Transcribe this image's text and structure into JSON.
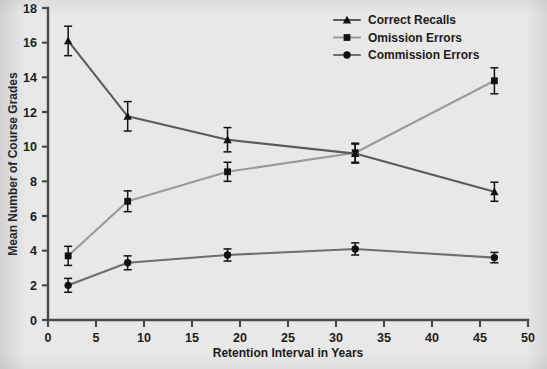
{
  "chart_data": {
    "type": "line",
    "title": "",
    "xlabel": "Retention Interval in Years",
    "ylabel": "Mean Number of Course Grades",
    "xlim": [
      0,
      50
    ],
    "ylim": [
      0,
      18
    ],
    "xticks": [
      0,
      5,
      10,
      15,
      20,
      25,
      30,
      35,
      40,
      45,
      50
    ],
    "yticks": [
      0,
      2,
      4,
      6,
      8,
      10,
      12,
      14,
      16,
      18
    ],
    "grid": false,
    "legend_position": "top-center-right",
    "x": [
      2.1,
      8.3,
      18.7,
      32.0,
      46.5
    ],
    "series": [
      {
        "name": "Correct Recalls",
        "marker": "triangle",
        "color": "#5a5a5a",
        "values": [
          16.1,
          11.75,
          10.4,
          9.6,
          7.4
        ],
        "errors": [
          0.85,
          0.85,
          0.7,
          0.55,
          0.55
        ]
      },
      {
        "name": "Omission Errors",
        "marker": "square",
        "color": "#9a9a9a",
        "values": [
          3.7,
          6.85,
          8.55,
          9.65,
          13.8
        ],
        "errors": [
          0.55,
          0.6,
          0.55,
          0.55,
          0.75
        ]
      },
      {
        "name": "Commission Errors",
        "marker": "circle",
        "color": "#6e6e6e",
        "values": [
          2.0,
          3.3,
          3.75,
          4.1,
          3.6
        ],
        "errors": [
          0.4,
          0.4,
          0.35,
          0.35,
          0.3
        ]
      }
    ]
  },
  "colors": {
    "background": "#e8e8e8",
    "axis": "#4a4a4a",
    "text": "#1b1b1b",
    "marker": "#111111"
  }
}
